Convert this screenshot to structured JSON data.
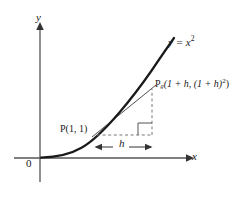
{
  "figure": {
    "axes": {
      "y_label": "y",
      "x_label": "x",
      "origin_label": "0"
    },
    "curve": {
      "label_prefix": "y = x",
      "label_exponent": "2",
      "color": "#1a1a1a",
      "stroke_width": 2.2
    },
    "secant": {
      "color": "#4d4d4d",
      "stroke_width": 1
    },
    "points": {
      "p": {
        "label": "P(1, 1)",
        "x_px": 95,
        "y_px": 135
      },
      "q": {
        "label_main": "P",
        "label_sub": "g",
        "label_args_a": "(1 + h, (1 + h)",
        "label_exponent": "2",
        "label_args_b": ")",
        "x_px": 152,
        "y_px": 90
      }
    },
    "delta": {
      "label": "h",
      "from_px": 95,
      "to_px": 152,
      "y_px": 147
    },
    "guides": {
      "dash_color": "#777777",
      "right_angle_marker": true
    },
    "colors": {
      "axis": "#555555",
      "ink": "#1a1a1a",
      "background": "#ffffff"
    }
  }
}
